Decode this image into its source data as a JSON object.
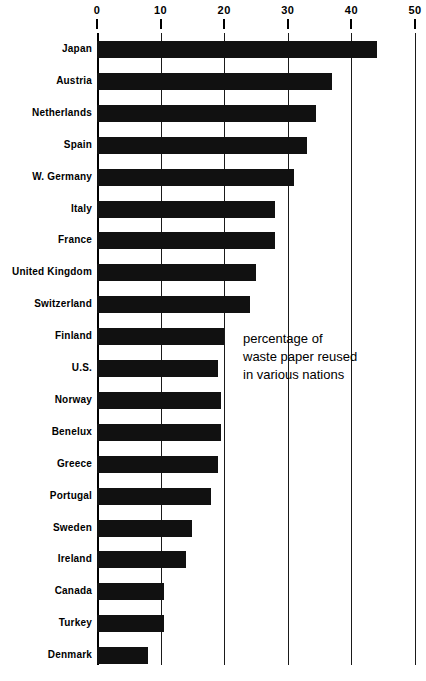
{
  "chart_data": {
    "type": "bar",
    "orientation": "horizontal",
    "title": "",
    "annotation": [
      "percentage of",
      "waste paper reused",
      "in various nations"
    ],
    "xlabel": "",
    "ylabel": "",
    "xlim": [
      0,
      50
    ],
    "grid": true,
    "legend": "none",
    "ticks": [
      0,
      10,
      20,
      30,
      40,
      50
    ],
    "tick_labels": [
      "0",
      "10",
      "20",
      "30",
      "40",
      "50"
    ],
    "categories": [
      "Japan",
      "Austria",
      "Netherlands",
      "Spain",
      "W. Germany",
      "Italy",
      "France",
      "United Kingdom",
      "Switzerland",
      "Finland",
      "U.S.",
      "Norway",
      "Benelux",
      "Greece",
      "Portugal",
      "Sweden",
      "Ireland",
      "Canada",
      "Turkey",
      "Denmark"
    ],
    "values": [
      44,
      37,
      34.5,
      33,
      31,
      28,
      28,
      25,
      24,
      20,
      19,
      19.5,
      19.5,
      19,
      18,
      15,
      14,
      10.5,
      10.5,
      8
    ],
    "bar_color": "#111111",
    "background_color": "#ffffff"
  },
  "rows": [
    {
      "label": "Japan",
      "value": 44
    },
    {
      "label": "Austria",
      "value": 37
    },
    {
      "label": "Netherlands",
      "value": 34.5
    },
    {
      "label": "Spain",
      "value": 33
    },
    {
      "label": "W. Germany",
      "value": 31
    },
    {
      "label": "Italy",
      "value": 28
    },
    {
      "label": "France",
      "value": 28
    },
    {
      "label": "United Kingdom",
      "value": 25
    },
    {
      "label": "Switzerland",
      "value": 24
    },
    {
      "label": "Finland",
      "value": 20
    },
    {
      "label": "U.S.",
      "value": 19
    },
    {
      "label": "Norway",
      "value": 19.5
    },
    {
      "label": "Benelux",
      "value": 19.5
    },
    {
      "label": "Greece",
      "value": 19
    },
    {
      "label": "Portugal",
      "value": 18
    },
    {
      "label": "Sweden",
      "value": 15
    },
    {
      "label": "Ireland",
      "value": 14
    },
    {
      "label": "Canada",
      "value": 10.5
    },
    {
      "label": "Turkey",
      "value": 10.5
    },
    {
      "label": "Denmark",
      "value": 8
    }
  ],
  "axis": {
    "ticks": [
      {
        "label": "0",
        "value": 0
      },
      {
        "label": "10",
        "value": 10
      },
      {
        "label": "20",
        "value": 20
      },
      {
        "label": "30",
        "value": 30
      },
      {
        "label": "40",
        "value": 40
      },
      {
        "label": "50",
        "value": 50
      }
    ]
  },
  "annotation": {
    "line1": "percentage of",
    "line2": "waste paper reused",
    "line3": "in various nations"
  }
}
